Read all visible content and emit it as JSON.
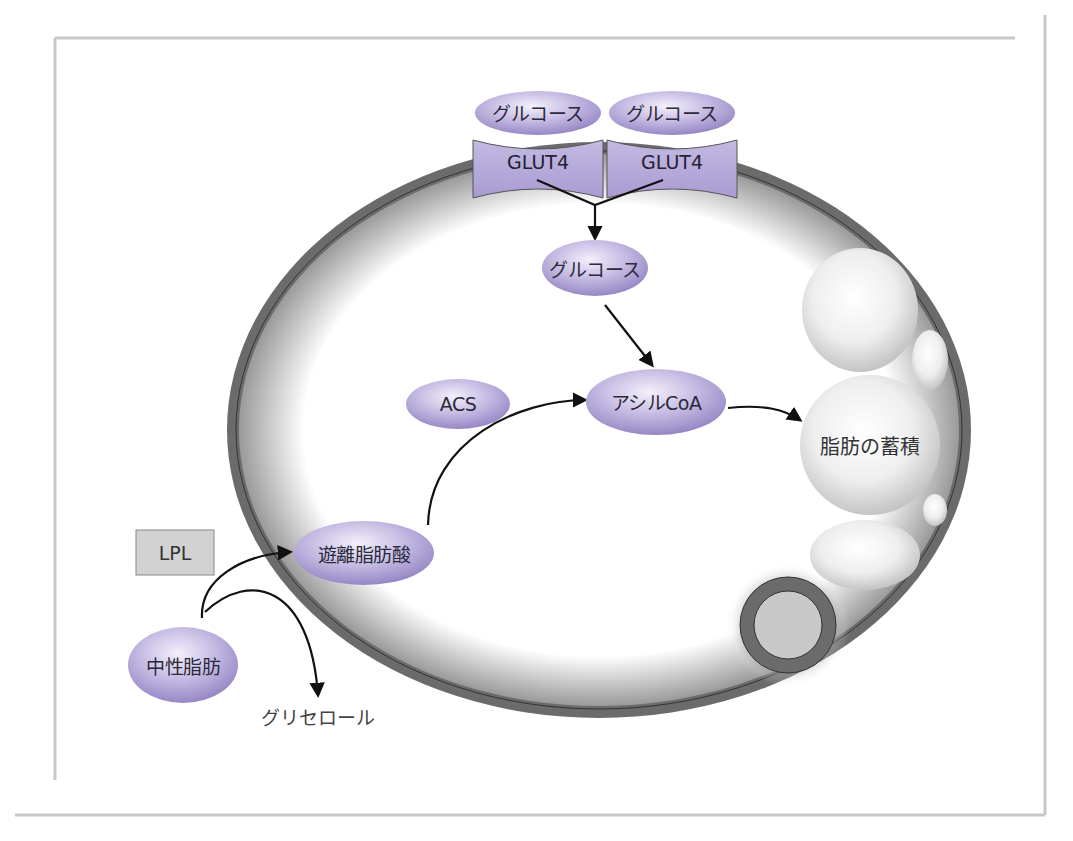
{
  "figure": {
    "frame_color": "#c8c8c8",
    "membrane_color": "#6b6b6b",
    "enzyme_color": "#b0a3d4",
    "enzyme_edge": "#8a7bbb"
  },
  "transporters": [
    {
      "substrate_label": "グルコース",
      "transporter_label": "GLUT4"
    },
    {
      "substrate_label": "グルコース",
      "transporter_label": "GLUT4"
    }
  ],
  "nodes": {
    "glucose_inner": "グルコース",
    "acyl_coa": "アシルCoA",
    "acs": "ACS",
    "free_fatty_acid": "遊離脂肪酸",
    "triglyceride": "中性脂肪",
    "lpl": "LPL",
    "glycerol": "グリセロール",
    "fat_storage": "脂肪の蓄積"
  }
}
